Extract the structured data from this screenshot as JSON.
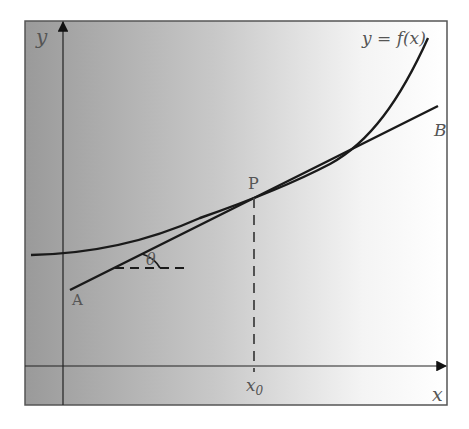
{
  "figure": {
    "title_label": "y = f(x)",
    "axis_labels": {
      "x": "x",
      "y": "y"
    },
    "point_labels": {
      "P": "P",
      "A": "A",
      "B": "B"
    },
    "angle_label": "θ",
    "x0_label": "x",
    "x0_subscript": "0",
    "colors": {
      "frame": "#555555",
      "background_dark": "#9a9a9a",
      "background_light": "#ffffff",
      "curve": "#1a1a1a",
      "text": "#555555"
    }
  }
}
